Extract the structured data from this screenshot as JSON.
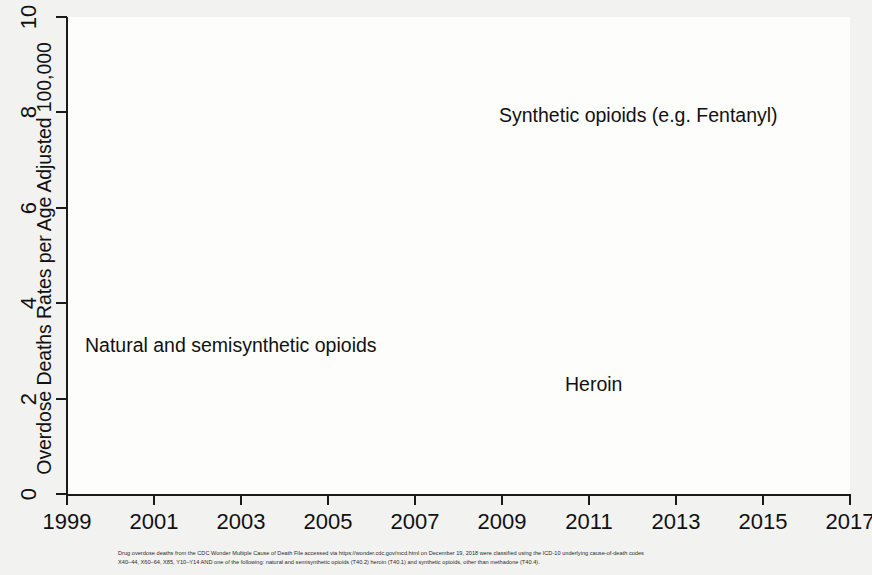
{
  "chart_data": {
    "type": "line",
    "title": "",
    "xlabel": "",
    "ylabel": "Overdose Deaths Rates per Age Adjusted 100,000",
    "xlim": [
      1999,
      2017
    ],
    "ylim": [
      0,
      10
    ],
    "xticks": [
      "1999",
      "2001",
      "2003",
      "2005",
      "2007",
      "2009",
      "2011",
      "2013",
      "2015",
      "2017"
    ],
    "yticks": [
      "0",
      "2",
      "4",
      "6",
      "8",
      "10"
    ],
    "grid": true,
    "legend_position": "inline-annotations",
    "x": [
      1999,
      2000,
      2001,
      2002,
      2003,
      2004,
      2005,
      2006,
      2007,
      2008,
      2009,
      2010,
      2011,
      2012,
      2013,
      2014,
      2015,
      2016,
      2017
    ],
    "series": [
      {
        "name": "Natural and semisynthetic opioids",
        "style": "solid",
        "color": "#111111",
        "values": [
          1.0,
          1.2,
          1.4,
          1.7,
          1.8,
          1.9,
          2.0,
          2.4,
          2.7,
          3.0,
          3.2,
          3.6,
          3.9,
          3.7,
          3.7,
          3.8,
          4.0,
          4.5,
          4.6
        ]
      },
      {
        "name": "Heroin",
        "style": "dashed",
        "color": "#111111",
        "values": [
          0.8,
          0.7,
          0.7,
          0.8,
          0.8,
          0.8,
          0.8,
          0.9,
          0.9,
          1.0,
          1.1,
          1.0,
          1.5,
          2.0,
          2.7,
          3.4,
          4.1,
          5.0,
          4.9
        ]
      },
      {
        "name": "Synthetic opioids (e.g. Fentanyl)",
        "style": "dotted",
        "color": "#111111",
        "values": [
          0.3,
          0.4,
          0.4,
          0.6,
          0.7,
          0.7,
          0.7,
          0.9,
          0.9,
          0.9,
          1.0,
          1.0,
          0.9,
          0.9,
          1.0,
          1.8,
          3.1,
          6.2,
          9.1
        ]
      }
    ],
    "annotations": [
      {
        "id": "synthetic",
        "text": "Synthetic opioids (e.g. Fentanyl)"
      },
      {
        "id": "natural",
        "text": "Natural and semisynthetic opioids"
      },
      {
        "id": "heroin",
        "text": "Heroin"
      }
    ]
  },
  "footnote": {
    "line1": "Drug overdose deaths from the CDC Wonder Multiple Cause of Death File accessed via https://wonder.cdc.gov/mcd.html on December 19, 2018 were classified using the ICD-10 underlying cause-of-death codes",
    "line2": "X40–44, X60–64, X85, Y10–Y14 AND one of the following: natural and semisynthetic opioids (T40.2) heroin (T40.1) and synthetic opioids, other than methadone (T40.4)."
  }
}
